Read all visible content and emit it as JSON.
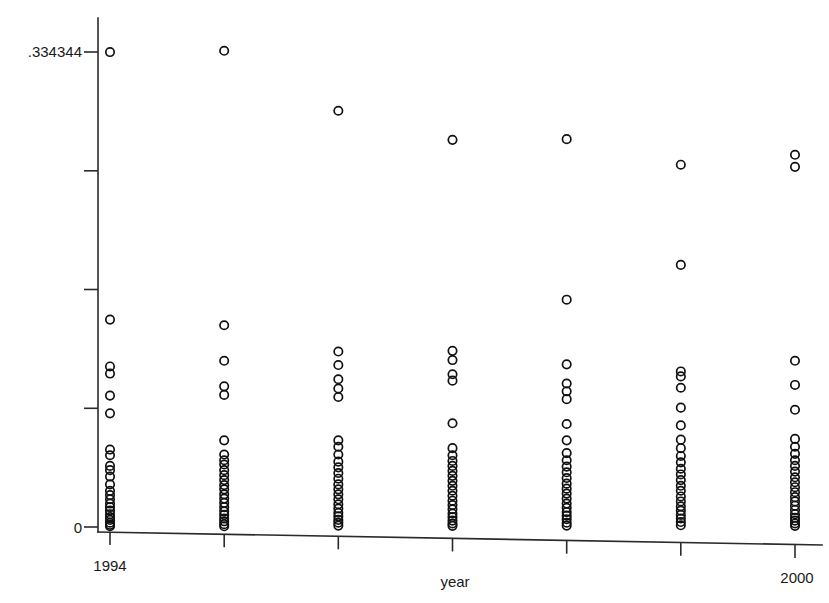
{
  "chart_data": {
    "type": "scatter",
    "title": "",
    "xlabel": "year",
    "ylabel": "",
    "grid": false,
    "legend": "none",
    "xlim": [
      1993.5,
      2000.5
    ],
    "ylim": [
      0,
      0.334344
    ],
    "y_tick_values": [
      0,
      0.083586,
      0.167172,
      0.250758,
      0.334344
    ],
    "y_tick_labels": [
      "0",
      "",
      "",
      "",
      ".334344"
    ],
    "x_tick_values": [
      1994,
      1995,
      1996,
      1997,
      1998,
      1999,
      2000
    ],
    "x_tick_labels": [
      "1994",
      "",
      "",
      "",
      "",
      "",
      "2000"
    ],
    "x": [
      1994,
      1995,
      1996,
      1997,
      1998,
      1999,
      2000
    ],
    "series": [
      {
        "name": "observations",
        "points_by_year": {
          "1994": [
            0.3343,
            0.146,
            0.113,
            0.108,
            0.0925,
            0.08,
            0.0545,
            0.0505,
            0.043,
            0.04,
            0.0355,
            0.03,
            0.0255,
            0.0225,
            0.0195,
            0.0165,
            0.014,
            0.0115,
            0.009,
            0.007,
            0.005,
            0.003,
            0.0015,
            0.0005
          ],
          "1995": [
            0.3352,
            0.142,
            0.117,
            0.099,
            0.093,
            0.061,
            0.051,
            0.047,
            0.044,
            0.04,
            0.0365,
            0.033,
            0.0295,
            0.0265,
            0.023,
            0.02,
            0.017,
            0.014,
            0.011,
            0.0085,
            0.006,
            0.004,
            0.002,
            0.0005
          ],
          "1996": [
            0.293,
            0.1235,
            0.114,
            0.104,
            0.0975,
            0.0915,
            0.061,
            0.0565,
            0.051,
            0.046,
            0.042,
            0.038,
            0.034,
            0.03,
            0.0265,
            0.023,
            0.0195,
            0.016,
            0.013,
            0.01,
            0.0075,
            0.005,
            0.003,
            0.001
          ],
          "1997": [
            0.2725,
            0.124,
            0.1175,
            0.1075,
            0.103,
            0.073,
            0.0555,
            0.0505,
            0.0465,
            0.043,
            0.0395,
            0.036,
            0.0325,
            0.029,
            0.0255,
            0.022,
            0.0185,
            0.0155,
            0.0125,
            0.0095,
            0.007,
            0.0045,
            0.0025,
            0.0008
          ],
          "1998": [
            0.273,
            0.16,
            0.1145,
            0.101,
            0.0955,
            0.09,
            0.0725,
            0.061,
            0.052,
            0.047,
            0.0425,
            0.0385,
            0.0345,
            0.0305,
            0.027,
            0.0235,
            0.02,
            0.0165,
            0.0135,
            0.0105,
            0.008,
            0.0055,
            0.003,
            0.001
          ],
          "1999": [
            0.255,
            0.1845,
            0.1095,
            0.106,
            0.098,
            0.084,
            0.0715,
            0.0615,
            0.0555,
            0.05,
            0.0455,
            0.041,
            0.037,
            0.033,
            0.029,
            0.0255,
            0.0215,
            0.018,
            0.0145,
            0.0115,
            0.0085,
            0.006,
            0.0035,
            0.0012
          ],
          "2000": [
            0.262,
            0.2535,
            0.117,
            0.1,
            0.0825,
            0.062,
            0.0565,
            0.0515,
            0.047,
            0.043,
            0.039,
            0.035,
            0.0315,
            0.028,
            0.0245,
            0.021,
            0.018,
            0.015,
            0.012,
            0.009,
            0.0065,
            0.0045,
            0.0025,
            0.0008
          ]
        }
      }
    ],
    "marker_style": {
      "shape": "open-circle",
      "radius_px": 4.2,
      "color": "#111111"
    }
  },
  "axes": {
    "y_top_label": ".334344",
    "y_bottom_label": "0",
    "x_left_label": "1994",
    "x_right_label": "2000",
    "x_title": "year"
  }
}
